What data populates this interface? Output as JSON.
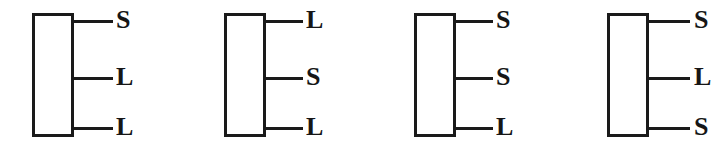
{
  "diagram": {
    "background_color": "#ffffff",
    "stroke_color": "#1a1a1a",
    "text_color": "#161616",
    "figures": [
      {
        "name": "figure-1",
        "block": {
          "x": 32,
          "y": 13,
          "width": 42,
          "height": 124
        },
        "terminals": [
          {
            "label": "S",
            "lead_x": 74,
            "lead_y": 20,
            "lead_width": 39,
            "label_x": 116,
            "label_y": 7
          },
          {
            "label": "L",
            "lead_x": 74,
            "lead_y": 77,
            "lead_width": 39,
            "label_x": 116,
            "label_y": 64
          },
          {
            "label": "L",
            "lead_x": 74,
            "lead_y": 127,
            "lead_width": 39,
            "label_x": 116,
            "label_y": 114
          }
        ]
      },
      {
        "name": "figure-2",
        "block": {
          "x": 224,
          "y": 13,
          "width": 42,
          "height": 124
        },
        "terminals": [
          {
            "label": "L",
            "lead_x": 266,
            "lead_y": 20,
            "lead_width": 37,
            "label_x": 306,
            "label_y": 7
          },
          {
            "label": "S",
            "lead_x": 266,
            "lead_y": 77,
            "lead_width": 37,
            "label_x": 306,
            "label_y": 64
          },
          {
            "label": "L",
            "lead_x": 266,
            "lead_y": 127,
            "lead_width": 37,
            "label_x": 306,
            "label_y": 114
          }
        ]
      },
      {
        "name": "figure-3",
        "block": {
          "x": 414,
          "y": 13,
          "width": 42,
          "height": 124
        },
        "terminals": [
          {
            "label": "S",
            "lead_x": 456,
            "lead_y": 20,
            "lead_width": 37,
            "label_x": 496,
            "label_y": 7
          },
          {
            "label": "S",
            "lead_x": 456,
            "lead_y": 77,
            "lead_width": 37,
            "label_x": 496,
            "label_y": 64
          },
          {
            "label": "L",
            "lead_x": 456,
            "lead_y": 127,
            "lead_width": 37,
            "label_x": 496,
            "label_y": 114
          }
        ]
      },
      {
        "name": "figure-4",
        "block": {
          "x": 607,
          "y": 13,
          "width": 42,
          "height": 124
        },
        "terminals": [
          {
            "label": "S",
            "lead_x": 649,
            "lead_y": 20,
            "lead_width": 41,
            "label_x": 694,
            "label_y": 7
          },
          {
            "label": "L",
            "lead_x": 649,
            "lead_y": 77,
            "lead_width": 41,
            "label_x": 694,
            "label_y": 64
          },
          {
            "label": "S",
            "lead_x": 649,
            "lead_y": 127,
            "lead_width": 41,
            "label_x": 694,
            "label_y": 114
          }
        ]
      }
    ]
  }
}
